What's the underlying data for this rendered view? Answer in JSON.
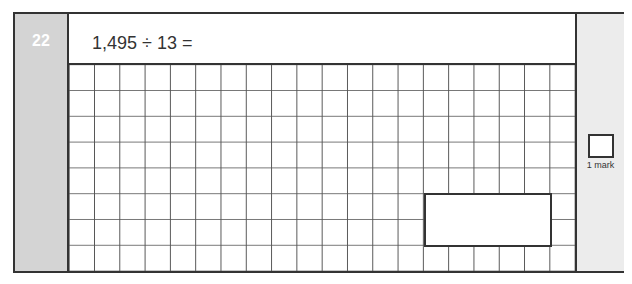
{
  "question": {
    "number": "22",
    "text": "1,495 ÷ 13 ="
  },
  "working_grid": {
    "columns": 20,
    "rows": 8
  },
  "answer_box": {
    "value": ""
  },
  "marks": {
    "label": "1 mark",
    "value": ""
  },
  "colors": {
    "left_panel": "#d4d4d4",
    "right_panel": "#ececec",
    "border": "#333333",
    "question_number_text": "#ffffff"
  }
}
